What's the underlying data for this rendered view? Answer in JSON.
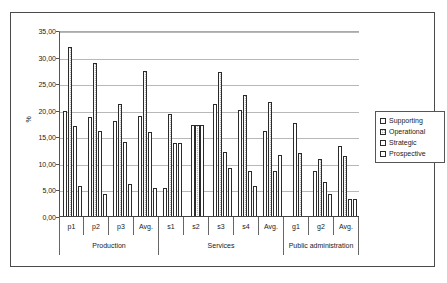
{
  "chart_data": {
    "type": "bar",
    "title": "",
    "subtitle": "",
    "xlabel": "",
    "ylabel": "%",
    "ylim": [
      0,
      35
    ],
    "ytick_step": 5,
    "ytick_labels": [
      "0,00",
      "5,00",
      "10,00",
      "15,00",
      "20,00",
      "25,00",
      "30,00",
      "35,00"
    ],
    "ytick_values": [
      0,
      5,
      10,
      15,
      20,
      25,
      30,
      35
    ],
    "grid": true,
    "legend_position": "right",
    "legend": [
      "Supporting",
      "Operational",
      "Strategic",
      "Prospective"
    ],
    "categories": [
      "p1",
      "p2",
      "p3",
      "Avg.",
      "s1",
      "s2",
      "s3",
      "s4",
      "Avg.",
      "g1",
      "g2",
      "Avg."
    ],
    "groups": [
      {
        "label": "Production",
        "categories": [
          "p1",
          "p2",
          "p3",
          "Avg."
        ]
      },
      {
        "label": "Services",
        "categories": [
          "s1",
          "s2",
          "s3",
          "s4",
          "Avg."
        ]
      },
      {
        "label": "Public administration",
        "categories": [
          "g1",
          "g2",
          "Avg."
        ]
      }
    ],
    "series": [
      {
        "name": "Supporting",
        "color": "#ffffff",
        "values": [
          20.0,
          18.9,
          18.0,
          19.1,
          5.5,
          17.3,
          21.2,
          20.1,
          16.1,
          17.7,
          8.7,
          13.4
        ]
      },
      {
        "name": "Operational",
        "color": "#b5b5b5",
        "values": [
          32.0,
          29.0,
          21.2,
          27.4,
          19.4,
          17.3,
          27.3,
          22.9,
          21.7,
          12.0,
          11.0,
          11.4
        ]
      },
      {
        "name": "Strategic",
        "color": "#ffffff",
        "values": [
          17.2,
          16.1,
          14.2,
          16.0,
          14.0,
          17.3,
          12.3,
          8.6,
          8.7,
          null,
          6.6,
          3.4
        ]
      },
      {
        "name": "Prospective",
        "color": "#ffffff",
        "values": [
          5.8,
          4.3,
          6.2,
          5.4,
          14.0,
          null,
          9.2,
          5.9,
          11.7,
          null,
          4.4,
          3.4
        ]
      }
    ]
  }
}
